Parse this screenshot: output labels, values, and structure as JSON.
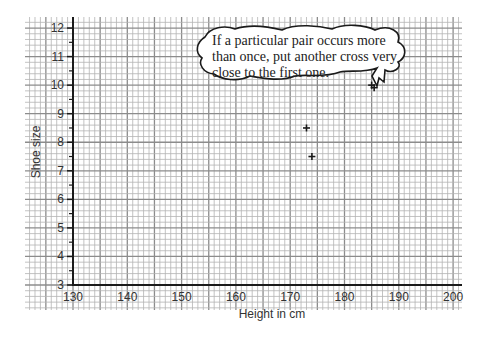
{
  "chart_data": {
    "type": "scatter",
    "title": "",
    "xlabel": "Height in cm",
    "ylabel": "Shoe size",
    "xlim": [
      130,
      200
    ],
    "ylim": [
      3,
      12
    ],
    "x_ticks": [
      130,
      140,
      150,
      160,
      170,
      180,
      190,
      200
    ],
    "y_ticks": [
      3,
      4,
      5,
      6,
      7,
      8,
      9,
      10,
      11,
      12
    ],
    "grid": true,
    "grid_style": "graph paper (1 cm minor, 5 cm major on x; 0.2 size minor, 1 size major on y)",
    "legend": null,
    "marker": "+",
    "points": [
      {
        "x": 173,
        "y": 8.5
      },
      {
        "x": 174,
        "y": 7.5
      },
      {
        "x": 185,
        "y": 10
      },
      {
        "x": 185,
        "y": 10
      }
    ],
    "annotations": [
      {
        "type": "speech-bubble",
        "text_lines": [
          "If a particular pair occurs more",
          "than once, put another cross very",
          "close to the first one."
        ],
        "points_to": {
          "x": 185,
          "y": 10
        }
      }
    ]
  },
  "labels": {
    "xlabel": "Height in cm",
    "ylabel": "Shoe size",
    "x_ticks": [
      "130",
      "140",
      "150",
      "160",
      "170",
      "180",
      "190",
      "200"
    ],
    "y_ticks": [
      "3",
      "4",
      "5",
      "6",
      "7",
      "8",
      "9",
      "10",
      "11",
      "12"
    ],
    "bubble": [
      "If a particular pair occurs more",
      "than once, put another cross very",
      "close to the first one."
    ]
  },
  "colors": {
    "grid_minor": "#b4b4b4",
    "grid_major": "#8c8c8c",
    "axis": "#1a1a1a",
    "marker": "#1a1a1a",
    "text": "#333333"
  }
}
